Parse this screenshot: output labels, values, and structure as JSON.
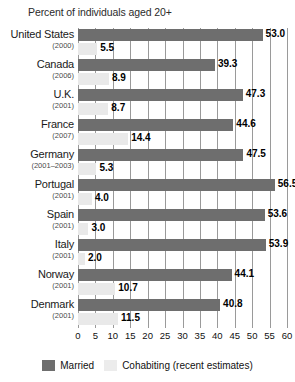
{
  "chart_data": {
    "type": "bar",
    "orientation": "horizontal",
    "title": "Percent of individuals aged 20+",
    "xlabel": "",
    "ylabel": "",
    "xlim": [
      0,
      60
    ],
    "xticks": [
      0,
      5,
      10,
      15,
      20,
      25,
      30,
      35,
      40,
      45,
      50,
      55,
      60
    ],
    "grid": true,
    "legend_position": "bottom",
    "categories": [
      "United States",
      "Canada",
      "U.K.",
      "France",
      "Germany",
      "Portugal",
      "Spain",
      "Italy",
      "Norway",
      "Denmark"
    ],
    "category_years": [
      "(2000)",
      "(2006)",
      "(2001)",
      "(2007)",
      "(2001–2003)",
      "(2001)",
      "(2001)",
      "(2001)",
      "(2001)",
      "(2001)"
    ],
    "series": [
      {
        "name": "Married",
        "color": "#6e6e6e",
        "values": [
          53.0,
          39.3,
          47.3,
          44.6,
          47.5,
          56.5,
          53.6,
          53.9,
          44.1,
          40.8
        ],
        "labels": [
          "53.0",
          "39.3",
          "47.3",
          "44.6",
          "47.5",
          "56.5",
          "53.6",
          "53.9",
          "44.1",
          "40.8"
        ]
      },
      {
        "name": "Cohabiting (recent estimates)",
        "color": "#e9e9e9",
        "values": [
          5.5,
          8.9,
          8.7,
          14.4,
          5.3,
          4.0,
          3.0,
          2.0,
          10.7,
          11.5
        ],
        "labels": [
          "5.5",
          "8.9",
          "8.7",
          "14.4",
          "5.3",
          "4.0",
          "3.0",
          "2.0",
          "10.7",
          "11.5"
        ]
      }
    ]
  },
  "legend": {
    "items": [
      {
        "label": "Married",
        "swatch": "married-swatch"
      },
      {
        "label": "Cohabiting (recent estimates)",
        "swatch": "cohabiting-swatch"
      }
    ]
  },
  "colors": {
    "married": "#6e6e6e",
    "cohabiting": "#e9e9e9",
    "gridline": "#9a9a9a",
    "text": "#1a1a1a",
    "background": "#ffffff"
  }
}
